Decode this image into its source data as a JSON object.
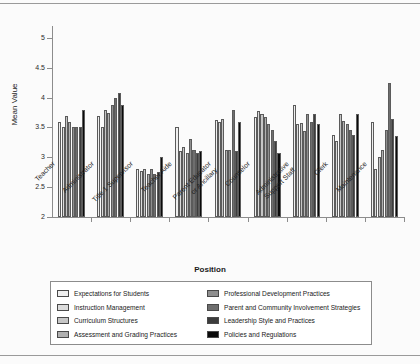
{
  "chart_data": {
    "type": "bar",
    "title": "",
    "xlabel": "Position",
    "ylabel": "Mean Value",
    "ylim": [
      2,
      5.2
    ],
    "yticks": [
      2,
      2.5,
      3,
      3.5,
      4,
      4.5,
      5
    ],
    "ytick_labels": [
      "2",
      "2.5",
      "3",
      "3.5",
      "4",
      "4.5",
      "5"
    ],
    "grid": false,
    "legend_position": "bottom",
    "categories": [
      "Teacher",
      "Administrator",
      "Title 1 Supervisor",
      "Teacher Aide",
      "Parent Educator\nor Ancillary",
      "Counselor",
      "Administrative\nSupport Staff",
      "Clerk",
      "Maintenance"
    ],
    "series": [
      {
        "name": "Expectations for Students",
        "color": "#efefef",
        "values": [
          3.6,
          3.7,
          2.8,
          3.5,
          3.62,
          3.67,
          3.88,
          3.37,
          3.6
        ]
      },
      {
        "name": "Instruction Management",
        "color": "#dcdcdc",
        "values": [
          3.5,
          3.5,
          2.77,
          3.1,
          3.6,
          3.78,
          3.55,
          3.27,
          2.8
        ]
      },
      {
        "name": "Curriculum Structures",
        "color": "#c6c6c6",
        "values": [
          3.7,
          3.8,
          2.8,
          3.17,
          3.65,
          3.72,
          3.57,
          3.72,
          3.0
        ]
      },
      {
        "name": "Assessment and Grading Practices",
        "color": "#b0b0b0",
        "values": [
          3.6,
          3.75,
          2.72,
          3.08,
          3.13,
          3.68,
          3.44,
          3.61,
          3.12
        ]
      },
      {
        "name": "Professional Development Practices",
        "color": "#8f8f8f",
        "values": [
          3.5,
          3.87,
          2.8,
          3.3,
          3.12,
          3.55,
          3.72,
          3.55,
          3.45
        ]
      },
      {
        "name": "Parent and Community Involvement Strategies",
        "color": "#6e6e6e",
        "values": [
          3.5,
          4.0,
          2.72,
          3.12,
          3.8,
          3.45,
          3.6,
          3.45,
          4.25
        ]
      },
      {
        "name": "Leadership Style and Practices",
        "color": "#3c3c3c",
        "values": [
          3.5,
          4.08,
          2.75,
          3.07,
          3.1,
          3.27,
          3.72,
          3.38,
          3.65
        ]
      },
      {
        "name": "Policies and Regulations",
        "color": "#0a0a0a",
        "values": [
          3.8,
          3.88,
          3.0,
          3.1,
          3.6,
          3.08,
          3.55,
          3.72,
          3.35
        ]
      }
    ]
  }
}
